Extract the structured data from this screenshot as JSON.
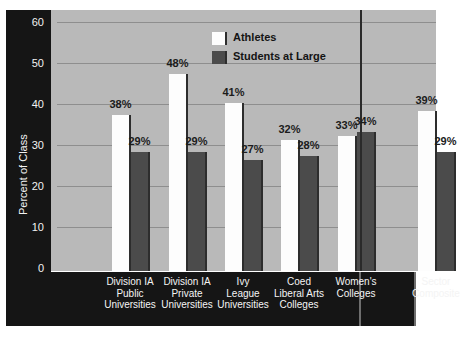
{
  "chart_data": {
    "type": "bar",
    "title": "",
    "xlabel": "",
    "ylabel": "Percent of Class",
    "ylim": [
      0,
      60
    ],
    "ytick_labels": [
      "60",
      "50",
      "40",
      "30",
      "20",
      "10",
      "0"
    ],
    "yticks": [
      60,
      50,
      40,
      30,
      20,
      10,
      0
    ],
    "grid": true,
    "legend_position": "top-center",
    "categories": [
      "Division IA Public Universities",
      "Division IA Private Universities",
      "Ivy League Universities",
      "Coed Liberal Arts Colleges",
      "Women's Colleges",
      "Sector Composite"
    ],
    "category_lines": [
      [
        "Division IA",
        "Public",
        "Universities"
      ],
      [
        "Division IA",
        "Private",
        "Universities"
      ],
      [
        "Ivy",
        "League",
        "Universities"
      ],
      [
        "Coed",
        "Liberal Arts",
        "Colleges"
      ],
      [
        "Women's",
        "Colleges"
      ],
      [
        "Sector",
        "Composite"
      ]
    ],
    "series": [
      {
        "name": "Athletes",
        "color": "#fdfdfd",
        "values": [
          38,
          48,
          41,
          32,
          33,
          39
        ],
        "labels": [
          "38%",
          "48%",
          "41%",
          "32%",
          "33%",
          "39%"
        ]
      },
      {
        "name": "Students at Large",
        "color": "#4b4b4b",
        "values": [
          29,
          29,
          27,
          28,
          34,
          29
        ],
        "labels": [
          "29%",
          "29%",
          "27%",
          "28%",
          "34%",
          "29%"
        ]
      }
    ],
    "annotations": [
      "vertical separator between Women's Colleges and Sector Composite"
    ],
    "colors": {
      "plot_background": "#b9b9b9",
      "frame_band": "#151515",
      "gridline": "#8e8e8e",
      "axis_text": "#f2f2f2",
      "value_text": "#1c1c1c"
    }
  },
  "legend": {
    "items": [
      {
        "label": "Athletes"
      },
      {
        "label": "Students at Large"
      }
    ]
  }
}
